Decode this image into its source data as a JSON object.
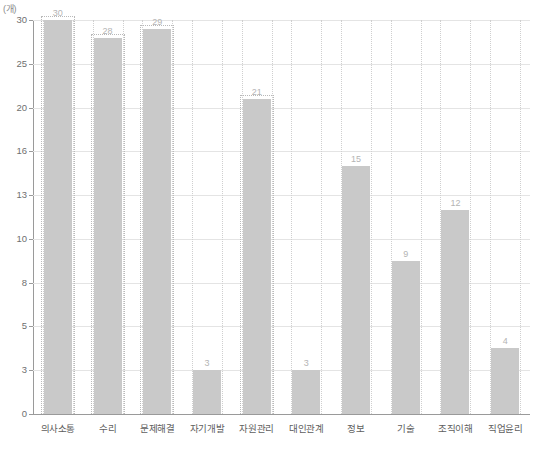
{
  "chart_data": {
    "type": "bar",
    "title": "",
    "subtitle": "",
    "unit_label": "(개)",
    "xlabel": "",
    "ylabel": "",
    "categories": [
      "의사소통",
      "수리",
      "문제해결",
      "자기개발",
      "자원관리",
      "대인관계",
      "정보",
      "기술",
      "조직이해",
      "직업윤리"
    ],
    "values": [
      30,
      28,
      29,
      3,
      21,
      3,
      15,
      9,
      12,
      4
    ],
    "value_labels": [
      "30",
      "28",
      "29",
      "3",
      "21",
      "3",
      "15",
      "9",
      "12",
      "4"
    ],
    "y_ticks": [
      0,
      3,
      5,
      8,
      10,
      13,
      16,
      20,
      25,
      30
    ],
    "y_tick_labels": [
      "0",
      "3",
      "5",
      "8",
      "10",
      "13",
      "16",
      "20",
      "25",
      "30"
    ],
    "ylim": [
      0,
      30
    ],
    "grid": true,
    "legend": "none",
    "legend_position": "none",
    "highlighted_categories": [
      "의사소통",
      "수리",
      "문제해결",
      "자원관리"
    ],
    "colors": {
      "bar": "#c9c9c9",
      "gridline": "#e4e4e4",
      "axis": "#9a9a9a",
      "tick_text": "#6f6f6f",
      "value_text": "#b4b4b4",
      "category_text": "#5e5e5e",
      "highlight_border": "#b9b9b9",
      "background": "#ffffff"
    }
  }
}
